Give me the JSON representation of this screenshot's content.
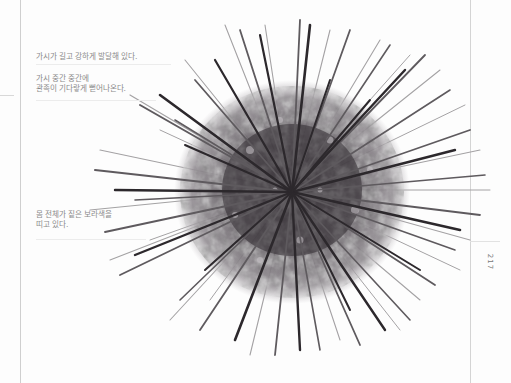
{
  "page": {
    "number": "217",
    "background": "#fdfdfd"
  },
  "illustration": {
    "subject": "sea-urchin",
    "colors": {
      "spine_dark": "#2e2a2e",
      "spine_mid": "#5a565a",
      "spine_light": "#9a989a",
      "body_dark": "#3c363c",
      "body_mid": "#6a646a",
      "body_light": "#a8a2a8"
    }
  },
  "annotations": [
    {
      "id": "spines",
      "lines": [
        "가시가 길고 강하게 발달해 있다."
      ]
    },
    {
      "id": "tube-feet",
      "lines": [
        "가시 중간 중간에",
        "관족이 기다랗게  뻗어나온다."
      ]
    },
    {
      "id": "body-color",
      "lines": [
        "몸 전체가 짙은 보라색을",
        "띠고 있다."
      ]
    }
  ]
}
